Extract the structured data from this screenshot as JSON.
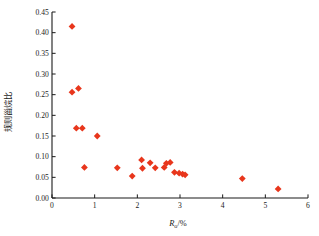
{
  "chart_data": {
    "type": "scatter",
    "title": "",
    "xlabel": "Ro/%",
    "ylabel": "规则甾烷比",
    "xlim": [
      0,
      6
    ],
    "ylim": [
      0.0,
      0.45
    ],
    "grid": false,
    "legend": "none",
    "marker": {
      "color": "#E8361C",
      "shape": "diamond",
      "size": 3.4
    },
    "xticks": [
      "0",
      "1",
      "2",
      "3",
      "4",
      "5",
      "6"
    ],
    "xtick_values": [
      0,
      1,
      2,
      3,
      4,
      5,
      6
    ],
    "yticks": [
      "0.00",
      "0.05",
      "0.10",
      "0.15",
      "0.20",
      "0.25",
      "0.30",
      "0.35",
      "0.40",
      "0.45"
    ],
    "ytick_values": [
      0.0,
      0.05,
      0.1,
      0.15,
      0.2,
      0.25,
      0.3,
      0.35,
      0.4,
      0.45
    ],
    "points": [
      {
        "x": 0.47,
        "y": 0.415
      },
      {
        "x": 0.47,
        "y": 0.256
      },
      {
        "x": 0.62,
        "y": 0.265
      },
      {
        "x": 0.57,
        "y": 0.169
      },
      {
        "x": 0.71,
        "y": 0.169
      },
      {
        "x": 1.06,
        "y": 0.15
      },
      {
        "x": 0.76,
        "y": 0.074
      },
      {
        "x": 1.53,
        "y": 0.073
      },
      {
        "x": 1.88,
        "y": 0.053
      },
      {
        "x": 2.1,
        "y": 0.092
      },
      {
        "x": 2.12,
        "y": 0.072
      },
      {
        "x": 2.42,
        "y": 0.073
      },
      {
        "x": 2.3,
        "y": 0.085
      },
      {
        "x": 2.68,
        "y": 0.084
      },
      {
        "x": 2.77,
        "y": 0.086
      },
      {
        "x": 2.63,
        "y": 0.074
      },
      {
        "x": 2.87,
        "y": 0.062
      },
      {
        "x": 2.98,
        "y": 0.06
      },
      {
        "x": 3.06,
        "y": 0.058
      },
      {
        "x": 3.12,
        "y": 0.056
      },
      {
        "x": 4.46,
        "y": 0.047
      },
      {
        "x": 5.3,
        "y": 0.022
      }
    ]
  },
  "axes": {
    "x_title_symbol": "R",
    "x_title_sub": "o",
    "x_title_unit": "/%",
    "y_title": "规则甾烷比"
  }
}
